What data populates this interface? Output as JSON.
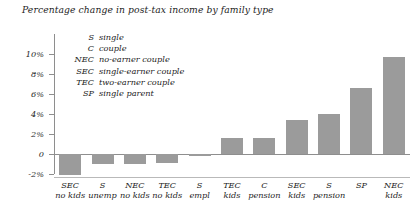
{
  "chart_data": {
    "type": "bar",
    "title": "Percentage change in post-tax income by family type",
    "xlabel": "",
    "ylabel": "",
    "ylim": [
      -2,
      10
    ],
    "ytick_labels": [
      "10%",
      "8%",
      "6%",
      "4%",
      "2%",
      "0",
      "-2%"
    ],
    "ytick_values": [
      10,
      8,
      6,
      4,
      2,
      0,
      -2
    ],
    "grid": false,
    "legend_position": "inside-top-left",
    "bar_color": "#9b9b9b",
    "axis_color": "#8e8e8e",
    "categories": [
      "SEC no kids",
      "S unemp",
      "NEC no kids",
      "TEC no kids",
      "S empl",
      "TEC kids",
      "C pension",
      "SEC kids",
      "S pension",
      "SP",
      "NEC kids"
    ],
    "category_lines": [
      {
        "line1": "SEC",
        "line2": "no kids"
      },
      {
        "line1": "S",
        "line2": "unemp"
      },
      {
        "line1": "NEC",
        "line2": "no kids"
      },
      {
        "line1": "TEC",
        "line2": "no kids"
      },
      {
        "line1": "S",
        "line2": "empl"
      },
      {
        "line1": "TEC",
        "line2": "kids"
      },
      {
        "line1": "C",
        "line2": "pension"
      },
      {
        "line1": "SEC",
        "line2": "kids"
      },
      {
        "line1": "S",
        "line2": "pension"
      },
      {
        "line1": "SP",
        "line2": ""
      },
      {
        "line1": "NEC",
        "line2": "kids"
      }
    ],
    "values": [
      -2.1,
      -1.0,
      -1.0,
      -0.85,
      -0.2,
      1.6,
      1.6,
      3.4,
      4.0,
      6.6,
      9.7
    ],
    "legend": [
      {
        "abbr": "S",
        "label": "single"
      },
      {
        "abbr": "C",
        "label": "couple"
      },
      {
        "abbr": "NEC",
        "label": "no-earner couple"
      },
      {
        "abbr": "SEC",
        "label": "single-earner couple"
      },
      {
        "abbr": "TEC",
        "label": "two-earner couple"
      },
      {
        "abbr": "SP",
        "label": "single parent"
      }
    ]
  }
}
